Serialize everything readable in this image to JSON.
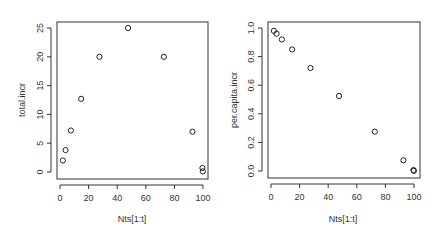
{
  "chart_data": [
    {
      "type": "scatter",
      "title": "",
      "xlabel": "Nts[1:t]",
      "ylabel": "total.incr",
      "xlim": [
        0,
        100
      ],
      "ylim": [
        0,
        25
      ],
      "xticks": [
        0,
        20,
        40,
        60,
        80,
        100
      ],
      "yticks": [
        0,
        5,
        10,
        15,
        20,
        25
      ],
      "grid": false,
      "legend": null,
      "x": [
        2,
        3.9,
        7.6,
        14.8,
        27.6,
        47.6,
        72.6,
        92.6,
        99.6,
        99.9
      ],
      "y": [
        2,
        3.8,
        7.2,
        12.7,
        20,
        25,
        20,
        7,
        0.7,
        0.1
      ]
    },
    {
      "type": "scatter",
      "title": "",
      "xlabel": "Nts[1:t]",
      "ylabel": "per.capita.incr",
      "xlim": [
        0,
        100
      ],
      "ylim": [
        0,
        1
      ],
      "xticks": [
        0,
        20,
        40,
        60,
        80,
        100
      ],
      "yticks": [
        0.0,
        0.2,
        0.4,
        0.6,
        0.8,
        1.0
      ],
      "grid": false,
      "legend": null,
      "x": [
        2,
        3.9,
        7.6,
        14.8,
        27.6,
        47.6,
        72.6,
        92.6,
        99.6,
        99.9
      ],
      "y": [
        0.98,
        0.96,
        0.92,
        0.85,
        0.72,
        0.525,
        0.275,
        0.075,
        0.007,
        0.001
      ]
    }
  ],
  "panels": [
    {
      "xlabel": "Nts[1:t]",
      "ylabel": "total.incr",
      "xtick_labels": [
        "0",
        "20",
        "40",
        "60",
        "80",
        "100"
      ],
      "ytick_labels": [
        "0",
        "5",
        "10",
        "15",
        "20",
        "25"
      ]
    },
    {
      "xlabel": "Nts[1:t]",
      "ylabel": "per.capita.incr",
      "xtick_labels": [
        "0",
        "20",
        "40",
        "60",
        "80",
        "100"
      ],
      "ytick_labels": [
        "0.0",
        "0.2",
        "0.4",
        "0.6",
        "0.8",
        "1.0"
      ]
    }
  ]
}
